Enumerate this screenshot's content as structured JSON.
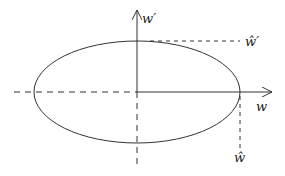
{
  "diagram": {
    "type": "ellipse-on-axes",
    "colors": {
      "stroke": "#333333",
      "background": "#ffffff"
    },
    "axes": {
      "horizontal_label": "w",
      "vertical_label": "w′"
    },
    "markers": {
      "horizontal_intercept_label": "ŵ",
      "vertical_intercept_label": "ŵ′"
    }
  }
}
